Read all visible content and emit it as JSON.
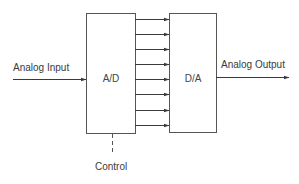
{
  "diagram": {
    "type": "block-diagram",
    "blocks": [
      {
        "id": "ad",
        "label": "A/D"
      },
      {
        "id": "da",
        "label": "D/A"
      }
    ],
    "input": {
      "label": "Analog Input"
    },
    "output": {
      "label": "Analog Output"
    },
    "control": {
      "label": "Control"
    },
    "parallel_bus": {
      "line_count": 8
    },
    "colors": {
      "line": "#3a3a3a",
      "box_border": "#555555",
      "text": "#3a3a3a",
      "background": "#ffffff"
    }
  }
}
